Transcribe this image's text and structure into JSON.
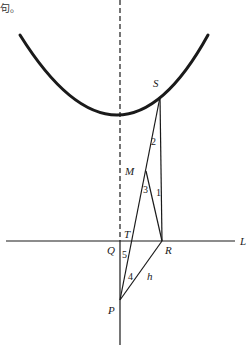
{
  "corner_text": "句。",
  "colors": {
    "stroke": "#1a1a1a",
    "background": "#ffffff"
  },
  "points": {
    "S": {
      "label": "S",
      "x": 160,
      "y": 97
    },
    "M": {
      "label": "M",
      "x": 146,
      "y": 171
    },
    "T": {
      "label": "T",
      "x": 133,
      "y": 241
    },
    "R": {
      "label": "R",
      "x": 162,
      "y": 241
    },
    "Q": {
      "label": "Q",
      "x": 120,
      "y": 241
    },
    "P": {
      "label": "P",
      "x": 120,
      "y": 300
    }
  },
  "line_label": "L",
  "segment_label": "h",
  "angle_labels": {
    "a1": "1",
    "a2": "2",
    "a3": "3",
    "a4": "4",
    "a5": "5"
  }
}
